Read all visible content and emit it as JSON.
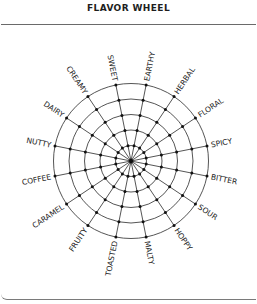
{
  "header": {
    "title": "FLAVOR WHEEL"
  },
  "colors": {
    "line": "#2a2a2a",
    "dot": "#111111",
    "text": "#222222",
    "frame": "#6a6a6a"
  },
  "chart_data": {
    "type": "radial-grid",
    "title": "FLAVOR WHEEL",
    "center": [
      131,
      161
    ],
    "ring_count": 5,
    "outer_radius": 77.5,
    "spoke_offset_deg": 11.25,
    "labels_clockwise_from_right": [
      "BITTER",
      "SOUR",
      "HOPPY",
      "MALTY",
      "TOASTED",
      "FRUITY",
      "CARAMEL",
      "COFFEE",
      "NUTTY",
      "DAIRY",
      "CREAMY",
      "SWEET",
      "EARTHY",
      "HERBAL",
      "FLORAL",
      "SPICY"
    ]
  }
}
